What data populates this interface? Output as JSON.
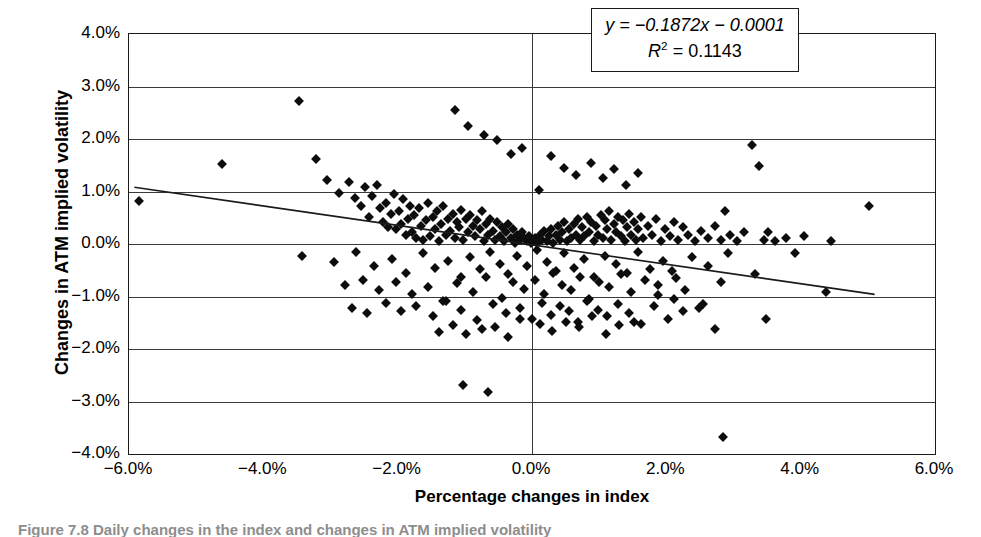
{
  "chart_data": {
    "type": "scatter",
    "title": "",
    "xlabel": "Percentage changes in index",
    "ylabel": "Changes in ATM implied volatility",
    "xlim": [
      -6.0,
      6.0
    ],
    "ylim": [
      -4.0,
      4.0
    ],
    "xticks": [
      "-6.0%",
      "-4.0%",
      "-2.0%",
      "0.0%",
      "2.0%",
      "4.0%",
      "6.0%"
    ],
    "xtick_values": [
      -6.0,
      -4.0,
      -2.0,
      0.0,
      2.0,
      4.0,
      6.0
    ],
    "yticks": [
      "4.0%",
      "3.0%",
      "2.0%",
      "1.0%",
      "0.0%",
      "-1.0%",
      "-2.0%",
      "-3.0%",
      "-4.0%"
    ],
    "ytick_values": [
      4.0,
      3.0,
      2.0,
      1.0,
      0.0,
      -1.0,
      -2.0,
      -3.0,
      -4.0
    ],
    "grid": "horizontal",
    "legend": "none",
    "marker": "diamond",
    "marker_color": "#0d0d0d",
    "annotations": {
      "equation_line1": "y = −0.1872x − 0.0001",
      "equation_line2": "R² = 0.1143",
      "slope": -0.1872,
      "intercept": -0.0001,
      "r_squared": 0.1143
    },
    "trendline": {
      "type": "linear",
      "x_start": -5.92,
      "y_start": 1.08,
      "x_end": 5.1,
      "y_end": -0.96
    },
    "x": [
      -5.85,
      -4.62,
      -3.47,
      -3.22,
      -3.05,
      -2.88,
      -2.72,
      -2.64,
      -2.55,
      -2.48,
      -2.42,
      -2.38,
      -2.31,
      -2.26,
      -2.22,
      -2.18,
      -2.14,
      -2.1,
      -2.06,
      -2.02,
      -1.98,
      -1.95,
      -1.92,
      -1.88,
      -1.85,
      -1.82,
      -1.78,
      -1.75,
      -1.72,
      -1.68,
      -1.65,
      -1.62,
      -1.58,
      -1.55,
      -1.52,
      -1.48,
      -1.45,
      -1.42,
      -1.38,
      -1.35,
      -1.32,
      -1.28,
      -1.25,
      -1.22,
      -1.18,
      -1.15,
      -1.12,
      -1.08,
      -1.05,
      -1.02,
      -0.98,
      -0.95,
      -0.92,
      -0.88,
      -0.85,
      -0.82,
      -0.78,
      -0.75,
      -0.72,
      -0.68,
      -0.65,
      -0.62,
      -0.58,
      -0.55,
      -0.52,
      -0.48,
      -0.45,
      -0.42,
      -0.38,
      -0.35,
      -0.32,
      -0.28,
      -0.25,
      -0.22,
      -0.18,
      -0.15,
      -0.12,
      -0.08,
      -0.05,
      -0.02,
      0.02,
      0.05,
      0.08,
      0.12,
      0.15,
      0.18,
      0.22,
      0.25,
      0.28,
      0.32,
      0.35,
      0.38,
      0.42,
      0.45,
      0.48,
      0.52,
      0.55,
      0.58,
      0.62,
      0.65,
      0.68,
      0.72,
      0.75,
      0.78,
      0.82,
      0.85,
      0.88,
      0.92,
      0.95,
      0.98,
      1.02,
      1.05,
      1.08,
      1.12,
      1.15,
      1.18,
      1.22,
      1.25,
      1.28,
      1.32,
      1.35,
      1.38,
      1.42,
      1.45,
      1.48,
      1.52,
      1.55,
      1.58,
      1.62,
      1.65,
      1.72,
      1.78,
      1.85,
      1.92,
      1.98,
      2.05,
      2.12,
      2.18,
      2.25,
      2.32,
      2.42,
      2.52,
      2.62,
      2.72,
      2.82,
      2.88,
      2.95,
      3.05,
      3.15,
      3.28,
      3.38,
      3.45,
      3.52,
      3.62,
      3.78,
      3.92,
      4.05,
      4.38,
      4.45,
      5.02,
      -3.42,
      -2.95,
      -2.62,
      -2.35,
      -2.08,
      -1.88,
      -1.62,
      -1.45,
      -1.25,
      -1.05,
      -0.92,
      -0.78,
      -0.62,
      -0.48,
      -0.35,
      -0.22,
      -0.08,
      0.08,
      0.22,
      0.35,
      0.48,
      0.62,
      0.78,
      0.92,
      1.08,
      1.25,
      1.42,
      1.58,
      1.75,
      1.95,
      2.15,
      2.38,
      2.62,
      2.92,
      3.32,
      3.48,
      -2.78,
      -2.52,
      -2.28,
      -2.02,
      -1.78,
      -1.55,
      -1.32,
      -1.12,
      -0.88,
      -0.68,
      -0.45,
      -0.28,
      -0.12,
      0.05,
      0.18,
      0.32,
      0.45,
      0.58,
      0.72,
      0.85,
      1.0,
      1.15,
      1.32,
      1.48,
      1.68,
      1.88,
      2.08,
      2.28,
      2.55,
      2.82,
      -2.68,
      -2.45,
      -2.18,
      -1.95,
      -1.72,
      -1.48,
      -1.28,
      -1.05,
      -0.82,
      -0.58,
      -0.38,
      -0.18,
      0.0,
      0.15,
      0.28,
      0.42,
      0.55,
      0.68,
      0.82,
      0.98,
      1.12,
      1.28,
      1.45,
      1.62,
      1.82,
      2.02,
      2.25,
      2.48,
      2.72,
      -1.15,
      -0.95,
      -0.72,
      -0.52,
      -0.32,
      -0.15,
      0.1,
      0.28,
      0.48,
      0.65,
      0.88,
      1.05,
      1.22,
      1.4,
      1.58,
      -1.38,
      -1.18,
      -0.98,
      -0.75,
      -0.55,
      -0.35,
      -0.18,
      0.12,
      0.3,
      0.5,
      0.7,
      0.9,
      1.1,
      1.3,
      1.52,
      2.85,
      -1.02,
      -0.65,
      1.88,
      2.12
    ],
    "y": [
      0.82,
      1.52,
      2.72,
      1.62,
      1.22,
      0.98,
      1.18,
      0.88,
      0.72,
      1.08,
      0.52,
      0.92,
      1.12,
      0.68,
      0.42,
      0.78,
      0.32,
      0.58,
      0.95,
      0.28,
      0.62,
      0.38,
      0.85,
      0.18,
      0.48,
      0.72,
      0.22,
      0.55,
      0.12,
      0.68,
      0.35,
      0.08,
      0.45,
      0.78,
      0.15,
      0.52,
      0.28,
      0.62,
      0.05,
      0.38,
      0.72,
      0.18,
      0.48,
      0.25,
      0.58,
      0.12,
      0.42,
      0.32,
      0.65,
      0.08,
      0.48,
      0.22,
      0.55,
      0.35,
      0.15,
      0.45,
      0.28,
      0.62,
      0.05,
      0.38,
      0.18,
      0.48,
      0.25,
      0.08,
      0.42,
      0.15,
      0.32,
      0.05,
      0.22,
      0.38,
      0.12,
      0.28,
      0.02,
      0.18,
      0.08,
      0.22,
      0.12,
      0.05,
      0.15,
      0.02,
      0.05,
      0.12,
      0.02,
      0.18,
      0.08,
      0.25,
      0.05,
      0.15,
      0.28,
      0.02,
      0.18,
      0.35,
      0.08,
      0.22,
      0.42,
      0.05,
      0.28,
      0.12,
      0.38,
      0.18,
      0.48,
      0.08,
      0.32,
      0.15,
      0.52,
      0.22,
      0.42,
      0.05,
      0.35,
      0.18,
      0.55,
      0.12,
      0.45,
      0.28,
      0.62,
      0.08,
      0.38,
      0.22,
      0.52,
      0.15,
      0.45,
      0.05,
      0.32,
      0.58,
      0.18,
      0.42,
      0.08,
      0.28,
      0.52,
      0.12,
      0.35,
      0.18,
      0.48,
      0.05,
      0.28,
      0.15,
      0.42,
      0.08,
      0.32,
      0.18,
      0.05,
      0.25,
      0.12,
      0.35,
      0.08,
      0.62,
      0.18,
      0.05,
      0.22,
      1.88,
      1.48,
      0.08,
      0.22,
      0.05,
      0.12,
      -0.18,
      0.15,
      -0.92,
      0.05,
      0.72,
      -0.22,
      -0.35,
      -0.15,
      -0.42,
      -0.28,
      -0.55,
      -0.18,
      -0.45,
      -0.32,
      -0.62,
      -0.25,
      -0.48,
      -0.15,
      -0.38,
      -0.58,
      -0.22,
      -0.42,
      -0.12,
      -0.35,
      -0.52,
      -0.18,
      -0.45,
      -0.28,
      -0.62,
      -0.22,
      -0.38,
      -0.55,
      -0.15,
      -0.48,
      -0.32,
      -0.65,
      -0.25,
      -0.42,
      -0.18,
      -0.58,
      -1.42,
      -0.78,
      -0.68,
      -0.88,
      -0.72,
      -0.95,
      -0.82,
      -1.08,
      -0.75,
      -0.92,
      -0.62,
      -1.02,
      -0.72,
      -0.85,
      -0.68,
      -0.95,
      -0.55,
      -0.78,
      -0.88,
      -0.62,
      -1.05,
      -0.72,
      -0.82,
      -0.58,
      -0.92,
      -0.68,
      -0.78,
      -0.52,
      -0.88,
      -1.15,
      -0.72,
      -1.22,
      -1.32,
      -1.12,
      -1.28,
      -1.18,
      -1.38,
      -1.08,
      -1.25,
      -1.45,
      -1.15,
      -1.32,
      -1.22,
      -1.42,
      -1.12,
      -1.35,
      -1.18,
      -1.28,
      -1.48,
      -1.08,
      -1.25,
      -1.38,
      -1.15,
      -1.32,
      -1.52,
      -1.18,
      -1.42,
      -1.28,
      -1.22,
      -1.62,
      2.55,
      2.25,
      2.08,
      1.98,
      1.72,
      1.82,
      1.02,
      1.68,
      1.45,
      1.32,
      1.55,
      1.25,
      1.42,
      1.12,
      1.35,
      -1.68,
      -1.55,
      -1.72,
      -1.62,
      -1.58,
      -1.78,
      -1.42,
      -1.52,
      -1.65,
      -1.48,
      -1.58,
      -1.38,
      -1.72,
      -1.55,
      -1.48,
      -3.68,
      -2.68,
      -2.82,
      -0.98,
      -1.05
    ]
  },
  "caption": {
    "text": "Figure 7.8   Daily changes in the index and changes in ATM implied volatility"
  }
}
